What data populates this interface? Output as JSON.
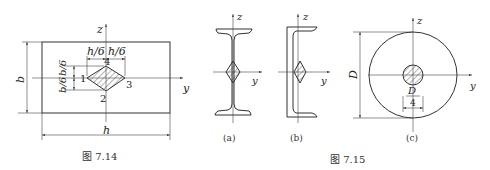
{
  "figure_7_14": {
    "caption": "图 7.14",
    "axis_z": "z",
    "axis_y": "y",
    "dim_b": "b",
    "dim_h": "h",
    "dim_h6_left": "h/6",
    "dim_h6_right": "h/6",
    "dim_b6_top": "b/6",
    "dim_b6_bottom": "b/6",
    "point_1": "1",
    "point_2": "2",
    "point_3": "3",
    "point_4": "4"
  },
  "figure_7_15": {
    "caption": "图 7.15",
    "sub_a": {
      "label": "(a)",
      "shape": "I-beam",
      "axis_z": "z",
      "axis_y": "y"
    },
    "sub_b": {
      "label": "(b)",
      "shape": "channel",
      "axis_z": "z",
      "axis_y": "y"
    },
    "sub_c": {
      "label": "(c)",
      "shape": "circle",
      "axis_z": "z",
      "axis_y": "y",
      "dim_D": "D",
      "dim_inner_num": "D",
      "dim_inner_den": "4"
    }
  }
}
